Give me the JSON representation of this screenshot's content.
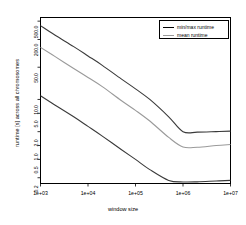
{
  "chart_data": {
    "type": "line",
    "title": "",
    "xlabel": "window size",
    "ylabel": "runtime [s] across all chromosomes",
    "xscale": "log",
    "yscale": "log",
    "xlim": [
      1000,
      10000000
    ],
    "ylim": [
      0.15,
      600
    ],
    "grid": false,
    "legend_position": "top-right",
    "xticks": [
      1000,
      10000,
      100000,
      1000000,
      10000000
    ],
    "xtick_labels": [
      "1e+03",
      "1e+04",
      "1e+05",
      "1e+06",
      "1e+07"
    ],
    "yticks": [
      0.2,
      0.5,
      1.0,
      2.0,
      5.0,
      10.0,
      50.0,
      200.0,
      500.0
    ],
    "ytick_labels": [
      "0.2",
      "0.5",
      "1.0",
      "2.0",
      "5.0",
      "10.0",
      "50.0",
      "200.0",
      "500.0"
    ],
    "x": [
      1000,
      2000,
      5000,
      10000,
      20000,
      50000,
      100000,
      200000,
      500000,
      1000000,
      2000000,
      5000000,
      10000000
    ],
    "series": [
      {
        "name": "max runtime",
        "color": "#3a3a3a",
        "values": [
          400,
          250,
          140,
          88,
          55,
          28,
          17,
          10,
          4.2,
          2.0,
          1.95,
          2.0,
          2.05
        ]
      },
      {
        "name": "mean runtime",
        "color": "#9a9a9a",
        "values": [
          135,
          86,
          47,
          30,
          19,
          9.5,
          5.8,
          3.4,
          1.5,
          0.93,
          0.92,
          1.0,
          1.05
        ]
      },
      {
        "name": "min runtime",
        "color": "#3a3a3a",
        "values": [
          12.0,
          7.6,
          4.2,
          2.6,
          1.6,
          0.82,
          0.5,
          0.3,
          0.175,
          0.162,
          0.163,
          0.17,
          0.175
        ]
      }
    ],
    "legend_entries": [
      {
        "label": "min/max runtime",
        "color": "#3a3a3a"
      },
      {
        "label": "mean runtime",
        "color": "#9a9a9a"
      }
    ]
  }
}
